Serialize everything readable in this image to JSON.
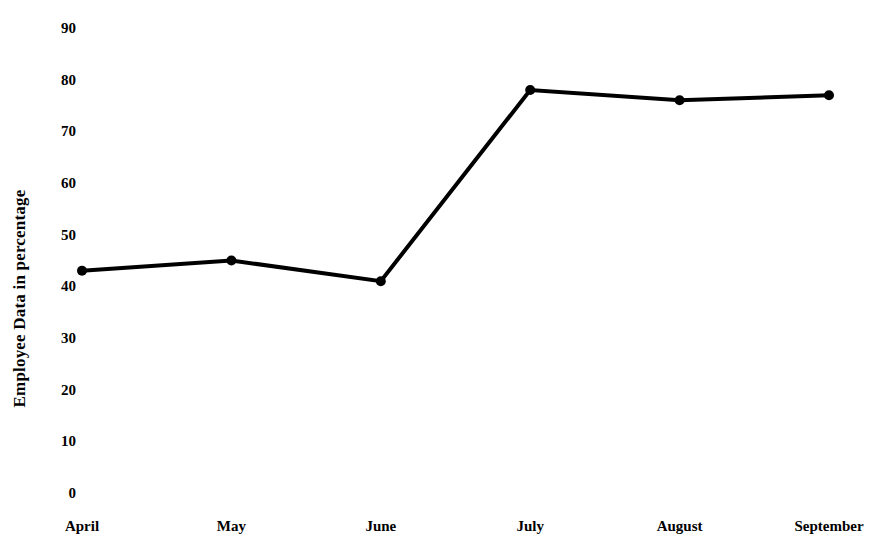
{
  "chart_data": {
    "type": "line",
    "title": "",
    "subtitle": "",
    "xlabel": "",
    "ylabel": "Employee Data in percentage",
    "categories": [
      "April",
      "May",
      "June",
      "July",
      "August",
      "September"
    ],
    "values": [
      43,
      45,
      41,
      78,
      76,
      77
    ],
    "series": [
      {
        "name": "Employee Data",
        "values": [
          43,
          45,
          41,
          78,
          76,
          77
        ]
      }
    ],
    "ylim": [
      0,
      90
    ],
    "ytick_labels": [
      "0",
      "10",
      "20",
      "30",
      "40",
      "50",
      "60",
      "70",
      "80",
      "90"
    ],
    "ytick_values": [
      0,
      10,
      20,
      30,
      40,
      50,
      60,
      70,
      80,
      90
    ],
    "xtick_labels": [
      "April",
      "May",
      "June",
      "July",
      "August",
      "September"
    ],
    "grid": false,
    "axis_lines": false,
    "legend": false,
    "legend_position": "none",
    "annotations": [],
    "style": {
      "background": "#ffffff",
      "line_color": "#000000",
      "marker_color": "#000000",
      "text_color": "#000000",
      "line_width": 4,
      "marker_size": 10
    }
  },
  "layout": {
    "plot_left": 82,
    "plot_right": 829,
    "plot_top": 28,
    "plot_bottom": 493,
    "x_label_y": 518
  }
}
